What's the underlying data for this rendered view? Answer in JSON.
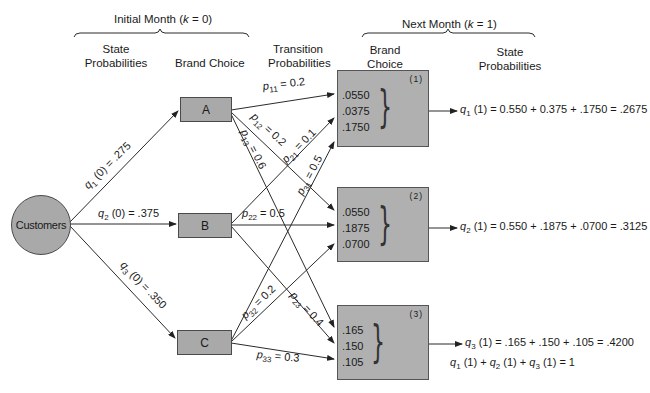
{
  "headers": {
    "initial_month": "Initial Month (k = 0)",
    "initial_month_prefix": "Initial Month (",
    "initial_month_k": "k",
    "initial_month_suffix": " = 0)",
    "next_month_prefix": "Next Month (",
    "next_month_k": "k",
    "next_month_suffix": " = 1)",
    "state_probabilities_line1": "State",
    "state_probabilities_line2": "Probabilities",
    "brand_choice": "Brand Choice",
    "transition_line1": "Transition",
    "transition_line2": "Probabilities",
    "next_brand_line1": "Brand",
    "next_brand_line2": "Choice",
    "next_state_line1": "State",
    "next_state_line2": "Probabilities"
  },
  "source_node": {
    "label": "Customers"
  },
  "brands": [
    {
      "label": "A"
    },
    {
      "label": "B"
    },
    {
      "label": "C"
    }
  ],
  "initial_probabilities": [
    {
      "var": "q",
      "sub": "1",
      "arg": " (0) = .275"
    },
    {
      "var": "q",
      "sub": "2",
      "arg": " (0) = .375"
    },
    {
      "var": "q",
      "sub": "3",
      "arg": " (0) = .350"
    }
  ],
  "transitions": [
    {
      "var": "p",
      "sub": "11",
      "val": " = 0.2"
    },
    {
      "var": "p",
      "sub": "12",
      "val": " = 0.2"
    },
    {
      "var": "p",
      "sub": "13",
      "val": " = 0.6"
    },
    {
      "var": "p",
      "sub": "21",
      "val": " = 0.1"
    },
    {
      "var": "p",
      "sub": "22",
      "val": " = 0.5"
    },
    {
      "var": "p",
      "sub": "23",
      "val": " = 0.4"
    },
    {
      "var": "p",
      "sub": "31",
      "val": " = 0.5"
    },
    {
      "var": "p",
      "sub": "32",
      "val": " = 0.2"
    },
    {
      "var": "p",
      "sub": "33",
      "val": " = 0.3"
    }
  ],
  "next_states": [
    {
      "index": "(1)",
      "values": [
        ".0550",
        ".0375",
        ".1750"
      ]
    },
    {
      "index": "(2)",
      "values": [
        ".0550",
        ".1875",
        ".0700"
      ]
    },
    {
      "index": "(3)",
      "values": [
        ".165",
        ".150",
        ".105"
      ]
    }
  ],
  "results": [
    {
      "var": "q",
      "sub": "1",
      "expr": " (1) = 0.550 + 0.375 + .1750 = .2675"
    },
    {
      "var": "q",
      "sub": "2",
      "expr": " (1) = 0.550 + .1875 + .0700 = .3125"
    },
    {
      "var": "q",
      "sub": "3",
      "expr": " (1) = .165 + .150 + .105 = .4200"
    }
  ],
  "sum_equation": {
    "parts": [
      {
        "var": "q",
        "sub": "1",
        "text": " (1) + "
      },
      {
        "var": "q",
        "sub": "2",
        "text": " (1) + "
      },
      {
        "var": "q",
        "sub": "3",
        "text": " (1) = 1"
      }
    ]
  },
  "colors": {
    "node_fill": "#a9a9a9",
    "state_fill": "#b0b0b0",
    "stroke": "#2a2a2a"
  }
}
